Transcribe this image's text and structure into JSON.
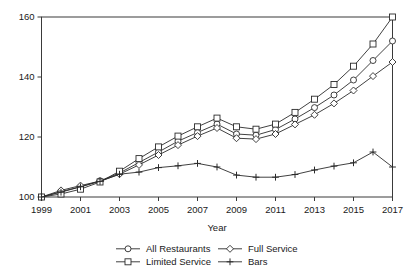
{
  "chart_data": {
    "type": "line",
    "title": "",
    "xlabel": "Year",
    "ylabel": "",
    "x": [
      1999,
      2000,
      2001,
      2002,
      2003,
      2004,
      2005,
      2006,
      2007,
      2008,
      2009,
      2010,
      2011,
      2012,
      2013,
      2014,
      2015,
      2016,
      2017
    ],
    "xlim": [
      1999,
      2017
    ],
    "ylim": [
      98,
      162
    ],
    "xticks": [
      1999,
      2001,
      2003,
      2005,
      2007,
      2009,
      2011,
      2013,
      2015,
      2017
    ],
    "xtick_labels": [
      "1999",
      "2001",
      "2003",
      "2005",
      "2007",
      "2009",
      "2011",
      "2013",
      "2015",
      "2017"
    ],
    "yticks": [
      100,
      120,
      140,
      160
    ],
    "ytick_labels": [
      "100",
      "120",
      "140",
      "160"
    ],
    "grid": false,
    "legend_position": "bottom",
    "series": [
      {
        "name": "All Restaurants",
        "marker": "circle",
        "values": [
          100.0,
          101.8,
          103.4,
          105.4,
          108.0,
          111.5,
          115.0,
          118.6,
          121.5,
          124.3,
          121.0,
          120.6,
          122.5,
          126.0,
          129.8,
          134.0,
          139.0,
          145.5,
          152.0
        ]
      },
      {
        "name": "Full Service",
        "marker": "diamond",
        "values": [
          100.0,
          102.2,
          103.8,
          105.3,
          107.6,
          110.7,
          114.0,
          117.3,
          120.3,
          123.0,
          119.6,
          119.3,
          121.0,
          124.2,
          127.4,
          131.2,
          135.5,
          140.3,
          145.0
        ]
      },
      {
        "name": "Limited Service",
        "marker": "square",
        "values": [
          100.0,
          101.0,
          102.6,
          105.0,
          108.6,
          112.8,
          116.7,
          120.3,
          123.4,
          126.3,
          123.4,
          122.6,
          124.3,
          128.2,
          132.6,
          137.5,
          143.6,
          151.0,
          160.0
        ]
      },
      {
        "name": "Bars",
        "marker": "plus",
        "values": [
          100.0,
          101.6,
          103.4,
          105.2,
          107.6,
          108.3,
          109.8,
          110.4,
          111.2,
          110.0,
          107.3,
          106.6,
          106.6,
          107.5,
          109.0,
          110.3,
          111.4,
          115.0,
          110.0
        ]
      }
    ]
  },
  "legend": {
    "items": [
      {
        "label": "All Restaurants",
        "marker": "circle"
      },
      {
        "label": "Full Service",
        "marker": "diamond"
      },
      {
        "label": "Limited Service",
        "marker": "square"
      },
      {
        "label": "Bars",
        "marker": "plus"
      }
    ]
  },
  "top_fragment": {
    "text": ""
  }
}
